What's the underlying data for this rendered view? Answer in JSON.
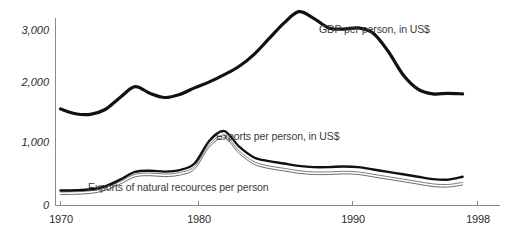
{
  "chart_data": {
    "type": "line",
    "title": "",
    "xlabel": "",
    "ylabel": "",
    "xlim": [
      1970,
      1998
    ],
    "ylim": [
      0,
      3300
    ],
    "grid": false,
    "legend_position": "inline-annotations",
    "x_tick_labels": [
      "1970",
      "1980",
      "1990",
      "1998"
    ],
    "x_tick_values": [
      1970,
      1980,
      1990,
      1998
    ],
    "y_tick_labels": [
      "0",
      "1,000",
      "2,000",
      "3,000"
    ],
    "y_tick_values": [
      0,
      1000,
      2000,
      3000
    ],
    "series": [
      {
        "name": "GDP per person, in US$",
        "annotation": "GDP per person, in US$",
        "style": "thick-black",
        "x": [
          1970,
          1971,
          1972,
          1973,
          1974,
          1975,
          1976,
          1977,
          1978,
          1979,
          1980,
          1981,
          1982,
          1983,
          1984,
          1985,
          1986,
          1987,
          1988,
          1989,
          1990,
          1991,
          1992,
          1993,
          1994,
          1995,
          1996,
          1997
        ],
        "values": [
          1610,
          1530,
          1520,
          1600,
          1800,
          1980,
          1870,
          1800,
          1850,
          1960,
          2060,
          2180,
          2320,
          2520,
          2780,
          3040,
          3230,
          3120,
          2960,
          2940,
          2960,
          2870,
          2570,
          2180,
          1940,
          1860,
          1870,
          1860
        ]
      },
      {
        "name": "Exports per person, in US$",
        "annotation": "Exports per person, in US$",
        "style": "medium-black",
        "x": [
          1970,
          1971,
          1972,
          1973,
          1974,
          1975,
          1976,
          1977,
          1978,
          1979,
          1980,
          1981,
          1982,
          1983,
          1984,
          1985,
          1986,
          1987,
          1988,
          1989,
          1990,
          1991,
          1992,
          1993,
          1994,
          1995,
          1996,
          1997
        ],
        "values": [
          250,
          255,
          270,
          320,
          430,
          560,
          580,
          565,
          590,
          700,
          1080,
          1240,
          980,
          800,
          740,
          700,
          660,
          640,
          640,
          650,
          640,
          600,
          560,
          520,
          480,
          440,
          430,
          480
        ]
      },
      {
        "name": "Exports of natural recources per person",
        "annotation": "Exports of natural recources per person",
        "style": "thin-grey-band",
        "x": [
          1970,
          1971,
          1972,
          1973,
          1974,
          1975,
          1976,
          1977,
          1978,
          1979,
          1980,
          1981,
          1982,
          1983,
          1984,
          1985,
          1986,
          1987,
          1988,
          1989,
          1990,
          1991,
          1992,
          1993,
          1994,
          1995,
          1996,
          1997
        ],
        "values": [
          225,
          230,
          245,
          295,
          400,
          520,
          540,
          525,
          550,
          650,
          1020,
          1170,
          910,
          730,
          660,
          620,
          580,
          560,
          560,
          570,
          560,
          520,
          480,
          440,
          400,
          360,
          350,
          385
        ]
      }
    ]
  },
  "axes": {
    "y_labels": [
      "3,000",
      "2,000",
      "1,000",
      "0"
    ],
    "x_labels": [
      "1970",
      "1980",
      "1990",
      "1998"
    ]
  },
  "annotations": {
    "gdp": "GDP per person, in US$",
    "exports": "Exports per person, in US$",
    "natural_resources": "Exports of natural recources per person"
  },
  "header": {
    "clipped_title": ""
  }
}
